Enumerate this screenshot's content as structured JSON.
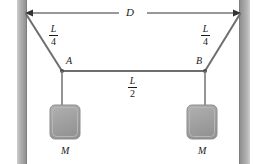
{
  "figure": {
    "canvas": {
      "width": 262,
      "height": 164,
      "background": "#ffffff"
    },
    "colors": {
      "wall": "#a8a8a8",
      "wall_edge": "#8c8c8c",
      "rope": "#666666",
      "block": "#a3a3a3",
      "block_edge": "#8f8f8f",
      "ink": "#1a1a1a"
    },
    "dimension": {
      "label": "D",
      "y": 13,
      "x_start": 25,
      "x_end": 241
    },
    "segments": {
      "left": {
        "numerator": "L",
        "denominator": "4"
      },
      "middle": {
        "numerator": "L",
        "denominator": "2"
      },
      "right": {
        "numerator": "L",
        "denominator": "4"
      }
    },
    "points": {
      "left": {
        "label": "A",
        "x": 62,
        "y": 71
      },
      "right": {
        "label": "B",
        "x": 205,
        "y": 71
      }
    },
    "masses": [
      {
        "label": "M",
        "x": 50,
        "y": 105,
        "w": 30,
        "h": 34
      },
      {
        "label": "M",
        "x": 187,
        "y": 105,
        "w": 30,
        "h": 34
      }
    ],
    "walls": [
      {
        "side": "left",
        "x": 17,
        "width": 10
      },
      {
        "side": "right",
        "x": 239,
        "width": 11
      }
    ]
  }
}
